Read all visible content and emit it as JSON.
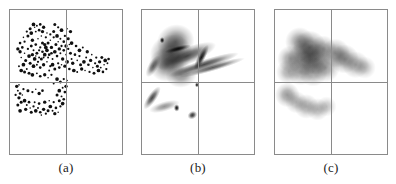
{
  "figure": {
    "background_color": "#ffffff",
    "frame_color": "#8a8a8a",
    "ink_color": "#101010",
    "panel_count": 3
  },
  "panels": [
    {
      "id": "panel-a",
      "caption": "(a)",
      "kind": "scatter",
      "left": 9,
      "axis_x_fraction": 0.5,
      "axis_y_fraction": 0.5
    },
    {
      "id": "panel-b",
      "caption": "(b)",
      "kind": "anisotropic-density",
      "left": 141,
      "axis_x_fraction": 0.5,
      "axis_y_fraction": 0.5
    },
    {
      "id": "panel-c",
      "caption": "(c)",
      "kind": "isotropic-density",
      "left": 274,
      "axis_x_fraction": 0.5,
      "axis_y_fraction": 0.5
    }
  ],
  "chart_data": {
    "type": "scatter",
    "title": "",
    "subtitle": "",
    "xlabel": "",
    "ylabel": "",
    "xlim": [
      0,
      1
    ],
    "ylim": [
      0,
      1
    ],
    "grid": false,
    "legend": null,
    "axis_lines": {
      "vertical_at_x": 0.5,
      "horizontal_at_y": 0.5,
      "color": "#8a8a8a"
    },
    "panels": [
      {
        "name": "(a)",
        "type": "scatter",
        "description": "Raw point pattern: dense upper-left cluster extending right across the vertical axis, plus a sparse lower-left arc below the horizontal axis.",
        "marker_color": "#101010",
        "point_count": 196,
        "points": [
          [
            0.13,
            0.7
          ],
          [
            0.16,
            0.73
          ],
          [
            0.19,
            0.75
          ],
          [
            0.17,
            0.68
          ],
          [
            0.21,
            0.72
          ],
          [
            0.23,
            0.76
          ],
          [
            0.2,
            0.79
          ],
          [
            0.25,
            0.8
          ],
          [
            0.27,
            0.74
          ],
          [
            0.24,
            0.7
          ],
          [
            0.22,
            0.66
          ],
          [
            0.26,
            0.67
          ],
          [
            0.29,
            0.71
          ],
          [
            0.31,
            0.76
          ],
          [
            0.28,
            0.82
          ],
          [
            0.32,
            0.81
          ],
          [
            0.34,
            0.77
          ],
          [
            0.33,
            0.72
          ],
          [
            0.3,
            0.67
          ],
          [
            0.35,
            0.69
          ],
          [
            0.37,
            0.74
          ],
          [
            0.36,
            0.79
          ],
          [
            0.39,
            0.81
          ],
          [
            0.41,
            0.76
          ],
          [
            0.4,
            0.71
          ],
          [
            0.38,
            0.66
          ],
          [
            0.42,
            0.68
          ],
          [
            0.44,
            0.73
          ],
          [
            0.43,
            0.78
          ],
          [
            0.46,
            0.75
          ],
          [
            0.18,
            0.63
          ],
          [
            0.21,
            0.61
          ],
          [
            0.24,
            0.62
          ],
          [
            0.27,
            0.6
          ],
          [
            0.3,
            0.62
          ],
          [
            0.33,
            0.64
          ],
          [
            0.36,
            0.61
          ],
          [
            0.14,
            0.65
          ],
          [
            0.12,
            0.62
          ],
          [
            0.15,
            0.59
          ],
          [
            0.11,
            0.74
          ],
          [
            0.09,
            0.71
          ],
          [
            0.1,
            0.67
          ],
          [
            0.13,
            0.78
          ],
          [
            0.16,
            0.82
          ],
          [
            0.19,
            0.84
          ],
          [
            0.23,
            0.85
          ],
          [
            0.26,
            0.86
          ],
          [
            0.29,
            0.85
          ],
          [
            0.22,
            0.88
          ],
          [
            0.25,
            0.64
          ],
          [
            0.28,
            0.66
          ],
          [
            0.31,
            0.69
          ],
          [
            0.34,
            0.67
          ],
          [
            0.37,
            0.7
          ],
          [
            0.2,
            0.69
          ],
          [
            0.23,
            0.68
          ],
          [
            0.26,
            0.72
          ],
          [
            0.29,
            0.77
          ],
          [
            0.32,
            0.74
          ],
          [
            0.45,
            0.7
          ],
          [
            0.48,
            0.72
          ],
          [
            0.47,
            0.66
          ],
          [
            0.5,
            0.69
          ],
          [
            0.52,
            0.73
          ],
          [
            0.54,
            0.7
          ],
          [
            0.51,
            0.64
          ],
          [
            0.55,
            0.66
          ],
          [
            0.58,
            0.69
          ],
          [
            0.56,
            0.63
          ],
          [
            0.6,
            0.65
          ],
          [
            0.62,
            0.68
          ],
          [
            0.63,
            0.62
          ],
          [
            0.66,
            0.64
          ],
          [
            0.68,
            0.67
          ],
          [
            0.7,
            0.62
          ],
          [
            0.72,
            0.65
          ],
          [
            0.74,
            0.6
          ],
          [
            0.76,
            0.63
          ],
          [
            0.78,
            0.61
          ],
          [
            0.57,
            0.58
          ],
          [
            0.6,
            0.57
          ],
          [
            0.53,
            0.59
          ],
          [
            0.49,
            0.61
          ],
          [
            0.46,
            0.62
          ],
          [
            0.43,
            0.63
          ],
          [
            0.4,
            0.59
          ],
          [
            0.38,
            0.62
          ],
          [
            0.35,
            0.58
          ],
          [
            0.44,
            0.6
          ],
          [
            0.64,
            0.59
          ],
          [
            0.67,
            0.58
          ],
          [
            0.71,
            0.57
          ],
          [
            0.75,
            0.56
          ],
          [
            0.79,
            0.58
          ],
          [
            0.81,
            0.6
          ],
          [
            0.83,
            0.57
          ],
          [
            0.8,
            0.64
          ],
          [
            0.84,
            0.62
          ],
          [
            0.86,
            0.59
          ],
          [
            0.17,
            0.56
          ],
          [
            0.2,
            0.55
          ],
          [
            0.24,
            0.56
          ],
          [
            0.27,
            0.54
          ],
          [
            0.31,
            0.55
          ],
          [
            0.34,
            0.53
          ],
          [
            0.37,
            0.55
          ],
          [
            0.13,
            0.57
          ],
          [
            0.1,
            0.58
          ],
          [
            0.08,
            0.61
          ],
          [
            0.09,
            0.77
          ],
          [
            0.07,
            0.73
          ],
          [
            0.12,
            0.81
          ],
          [
            0.15,
            0.85
          ],
          [
            0.18,
            0.87
          ],
          [
            0.21,
            0.9
          ],
          [
            0.24,
            0.89
          ],
          [
            0.27,
            0.9
          ],
          [
            0.3,
            0.88
          ],
          [
            0.33,
            0.84
          ],
          [
            0.36,
            0.83
          ],
          [
            0.39,
            0.85
          ],
          [
            0.42,
            0.82
          ],
          [
            0.45,
            0.8
          ],
          [
            0.48,
            0.78
          ],
          [
            0.5,
            0.75
          ],
          [
            0.53,
            0.76
          ],
          [
            0.49,
            0.82
          ],
          [
            0.52,
            0.8
          ],
          [
            0.55,
            0.77
          ],
          [
            0.07,
            0.44
          ],
          [
            0.09,
            0.42
          ],
          [
            0.08,
            0.39
          ],
          [
            0.11,
            0.41
          ],
          [
            0.12,
            0.45
          ],
          [
            0.1,
            0.36
          ],
          [
            0.13,
            0.37
          ],
          [
            0.15,
            0.34
          ],
          [
            0.17,
            0.36
          ],
          [
            0.14,
            0.31
          ],
          [
            0.18,
            0.32
          ],
          [
            0.21,
            0.33
          ],
          [
            0.19,
            0.29
          ],
          [
            0.23,
            0.3
          ],
          [
            0.25,
            0.32
          ],
          [
            0.27,
            0.29
          ],
          [
            0.3,
            0.31
          ],
          [
            0.28,
            0.27
          ],
          [
            0.32,
            0.28
          ],
          [
            0.34,
            0.3
          ],
          [
            0.36,
            0.33
          ],
          [
            0.38,
            0.3
          ],
          [
            0.41,
            0.32
          ],
          [
            0.4,
            0.28
          ],
          [
            0.43,
            0.29
          ],
          [
            0.45,
            0.33
          ],
          [
            0.44,
            0.37
          ],
          [
            0.47,
            0.35
          ],
          [
            0.46,
            0.4
          ],
          [
            0.48,
            0.38
          ],
          [
            0.06,
            0.47
          ],
          [
            0.08,
            0.48
          ],
          [
            0.05,
            0.41
          ],
          [
            0.07,
            0.34
          ],
          [
            0.09,
            0.3
          ],
          [
            0.22,
            0.36
          ],
          [
            0.26,
            0.35
          ],
          [
            0.31,
            0.36
          ],
          [
            0.35,
            0.37
          ],
          [
            0.39,
            0.36
          ],
          [
            0.42,
            0.41
          ],
          [
            0.44,
            0.44
          ],
          [
            0.47,
            0.46
          ],
          [
            0.49,
            0.43
          ],
          [
            0.5,
            0.47
          ],
          [
            0.51,
            0.51
          ],
          [
            0.48,
            0.52
          ],
          [
            0.45,
            0.5
          ],
          [
            0.42,
            0.52
          ],
          [
            0.39,
            0.49
          ],
          [
            0.29,
            0.44
          ],
          [
            0.26,
            0.42
          ],
          [
            0.23,
            0.45
          ],
          [
            0.2,
            0.43
          ],
          [
            0.16,
            0.44
          ],
          [
            0.62,
            0.72
          ],
          [
            0.65,
            0.74
          ],
          [
            0.59,
            0.75
          ],
          [
            0.69,
            0.71
          ],
          [
            0.73,
            0.69
          ],
          [
            0.77,
            0.67
          ],
          [
            0.82,
            0.67
          ],
          [
            0.85,
            0.65
          ],
          [
            0.87,
            0.63
          ],
          [
            0.88,
            0.66
          ],
          [
            0.54,
            0.85
          ],
          [
            0.51,
            0.87
          ],
          [
            0.43,
            0.88
          ],
          [
            0.4,
            0.9
          ],
          [
            0.46,
            0.86
          ]
        ]
      },
      {
        "name": "(b)",
        "type": "heatmap",
        "description": "Adaptive anisotropic kernel density estimate of the same points; elongated directional smears along the cluster's principal axes with sharp ridge-like streaks crossing the vertical axis.",
        "colormap": "grayscale-inverted",
        "kernels": [
          {
            "cx": 0.3,
            "cy": 0.78,
            "rx": 0.17,
            "ry": 0.12,
            "angle": -20,
            "intensity": 0.55
          },
          {
            "cx": 0.26,
            "cy": 0.7,
            "rx": 0.19,
            "ry": 0.13,
            "angle": -10,
            "intensity": 0.62
          },
          {
            "cx": 0.22,
            "cy": 0.62,
            "rx": 0.16,
            "ry": 0.12,
            "angle": 5,
            "intensity": 0.5
          },
          {
            "cx": 0.4,
            "cy": 0.68,
            "rx": 0.28,
            "ry": 0.06,
            "angle": -22,
            "intensity": 0.7
          },
          {
            "cx": 0.55,
            "cy": 0.62,
            "rx": 0.33,
            "ry": 0.035,
            "angle": -18,
            "intensity": 0.72
          },
          {
            "cx": 0.63,
            "cy": 0.6,
            "rx": 0.3,
            "ry": 0.025,
            "angle": -16,
            "intensity": 0.65
          },
          {
            "cx": 0.32,
            "cy": 0.73,
            "rx": 0.12,
            "ry": 0.02,
            "angle": -14,
            "intensity": 0.9
          },
          {
            "cx": 0.53,
            "cy": 0.67,
            "rx": 0.035,
            "ry": 0.1,
            "angle": 28,
            "intensity": 0.92
          },
          {
            "cx": 0.1,
            "cy": 0.61,
            "rx": 0.045,
            "ry": 0.085,
            "angle": 30,
            "intensity": 0.6
          },
          {
            "cx": 0.18,
            "cy": 0.79,
            "rx": 0.022,
            "ry": 0.022,
            "angle": 0,
            "intensity": 0.95
          },
          {
            "cx": 0.35,
            "cy": 0.55,
            "rx": 0.14,
            "ry": 0.09,
            "angle": -8,
            "intensity": 0.45
          },
          {
            "cx": 0.09,
            "cy": 0.39,
            "rx": 0.04,
            "ry": 0.095,
            "angle": 35,
            "intensity": 0.72
          },
          {
            "cx": 0.2,
            "cy": 0.33,
            "rx": 0.14,
            "ry": 0.035,
            "angle": -16,
            "intensity": 0.42
          },
          {
            "cx": 0.31,
            "cy": 0.32,
            "rx": 0.026,
            "ry": 0.026,
            "angle": 0,
            "intensity": 0.95
          },
          {
            "cx": 0.45,
            "cy": 0.27,
            "rx": 0.045,
            "ry": 0.028,
            "angle": -28,
            "intensity": 0.8
          },
          {
            "cx": 0.49,
            "cy": 0.48,
            "rx": 0.018,
            "ry": 0.018,
            "angle": 0,
            "intensity": 0.95
          }
        ]
      },
      {
        "name": "(c)",
        "type": "heatmap",
        "description": "Fixed-bandwidth isotropic kernel density estimate of the same points; round overlapping Gaussian blobs of uniform width, oversmoothing the fine structure.",
        "colormap": "grayscale-inverted",
        "kernels": [
          {
            "cx": 0.22,
            "cy": 0.78,
            "r": 0.13,
            "intensity": 0.42
          },
          {
            "cx": 0.31,
            "cy": 0.74,
            "r": 0.15,
            "intensity": 0.55
          },
          {
            "cx": 0.26,
            "cy": 0.66,
            "r": 0.15,
            "intensity": 0.5
          },
          {
            "cx": 0.36,
            "cy": 0.66,
            "r": 0.14,
            "intensity": 0.48
          },
          {
            "cx": 0.14,
            "cy": 0.66,
            "r": 0.12,
            "intensity": 0.4
          },
          {
            "cx": 0.12,
            "cy": 0.57,
            "r": 0.11,
            "intensity": 0.34
          },
          {
            "cx": 0.43,
            "cy": 0.73,
            "r": 0.12,
            "intensity": 0.38
          },
          {
            "cx": 0.54,
            "cy": 0.7,
            "r": 0.13,
            "intensity": 0.42
          },
          {
            "cx": 0.62,
            "cy": 0.66,
            "r": 0.13,
            "intensity": 0.45
          },
          {
            "cx": 0.72,
            "cy": 0.62,
            "r": 0.12,
            "intensity": 0.36
          },
          {
            "cx": 0.8,
            "cy": 0.6,
            "r": 0.1,
            "intensity": 0.26
          },
          {
            "cx": 0.45,
            "cy": 0.6,
            "r": 0.13,
            "intensity": 0.4
          },
          {
            "cx": 0.34,
            "cy": 0.57,
            "r": 0.13,
            "intensity": 0.38
          },
          {
            "cx": 0.23,
            "cy": 0.57,
            "r": 0.12,
            "intensity": 0.34
          },
          {
            "cx": 0.11,
            "cy": 0.41,
            "r": 0.11,
            "intensity": 0.4
          },
          {
            "cx": 0.19,
            "cy": 0.36,
            "r": 0.1,
            "intensity": 0.3
          },
          {
            "cx": 0.28,
            "cy": 0.33,
            "r": 0.11,
            "intensity": 0.35
          },
          {
            "cx": 0.38,
            "cy": 0.31,
            "r": 0.1,
            "intensity": 0.3
          },
          {
            "cx": 0.46,
            "cy": 0.33,
            "r": 0.09,
            "intensity": 0.24
          }
        ]
      }
    ]
  }
}
